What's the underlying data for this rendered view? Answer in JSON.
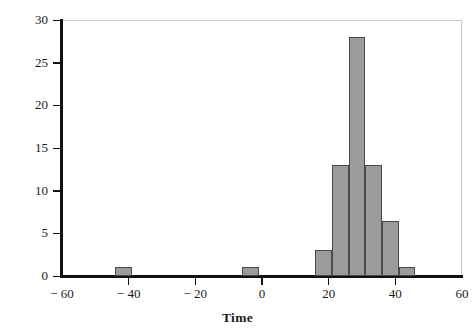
{
  "chart_data": {
    "type": "bar",
    "title": "",
    "subtitle": "",
    "xlabel": "Time",
    "ylabel": "Erequency",
    "xlim": [
      -60,
      60
    ],
    "ylim": [
      0,
      30
    ],
    "grid": false,
    "legend": null,
    "bin_width": 5,
    "bar_color": "#9b9b9b",
    "bar_edge_color": "#4a4a4a",
    "axis_color": "#111111",
    "x_ticks": [
      -60,
      -40,
      -20,
      0,
      20,
      40,
      60
    ],
    "x_tick_labels": [
      "− 60",
      "− 40",
      "− 20",
      "0",
      "20",
      "40",
      "60"
    ],
    "y_ticks": [
      0,
      5,
      10,
      15,
      20,
      25,
      30
    ],
    "y_tick_labels": [
      "0",
      "5",
      "10",
      "15",
      "20",
      "25",
      "30"
    ],
    "bins": [
      {
        "label": "[-44, -39]",
        "x_left": -44,
        "x_right": -39,
        "value": 1
      },
      {
        "label": "[-6, -1]",
        "x_left": -6,
        "x_right": -1,
        "value": 1
      },
      {
        "label": "[16, 21]",
        "x_left": 16,
        "x_right": 21,
        "value": 3
      },
      {
        "label": "[21, 26]",
        "x_left": 21,
        "x_right": 26,
        "value": 13
      },
      {
        "label": "[26, 31]",
        "x_left": 26,
        "x_right": 31,
        "value": 28
      },
      {
        "label": "[31, 36]",
        "x_left": 31,
        "x_right": 36,
        "value": 13
      },
      {
        "label": "[36, 41]",
        "x_left": 36,
        "x_right": 41,
        "value": 6.5
      },
      {
        "label": "[41, 46]",
        "x_left": 41,
        "x_right": 46,
        "value": 1
      }
    ]
  }
}
